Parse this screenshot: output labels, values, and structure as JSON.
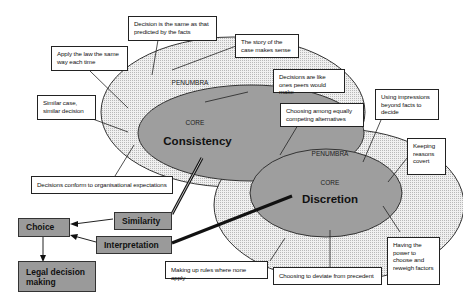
{
  "consistency": {
    "penumbra_label": "PENUMBRA",
    "core_label": "CORE",
    "title": "Consistency",
    "notes": [
      "Decision is the same as that predicted by the facts",
      "Apply the law the same way each time",
      "The story of the case makes sense",
      "Decisions are like ones peers would make",
      "Similar case, similar decision",
      "Decisions conform to organisational expectations"
    ]
  },
  "discretion": {
    "penumbra_label": "PENUMBRA",
    "core_label": "CORE",
    "title": "Discretion",
    "notes": [
      "Choosing among  equally competing alternatives",
      "Using impressions beyond facts to decide",
      "Keeping reasons covert",
      "Having the power to choose and reweigh factors",
      "Making up rules where none apply",
      "Choosing to deviate from precedent"
    ]
  },
  "flow": {
    "similarity": "Similarity",
    "interpretation": "Interpretation",
    "choice": "Choice",
    "legal_decision": "Legal decision making"
  },
  "colors": {
    "penumbra_fill": "#e4e4e4",
    "core_fill": "#9e9e9e",
    "box_fill": "#9a9a9a",
    "line": "#111111"
  }
}
